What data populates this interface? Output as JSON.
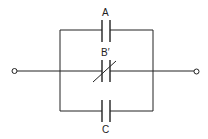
{
  "diagram": {
    "type": "circuit",
    "colors": {
      "line": "#222222",
      "background": "#ffffff"
    },
    "terminals": [
      {
        "id": "left-terminal"
      },
      {
        "id": "right-terminal"
      }
    ],
    "components": [
      {
        "id": "capacitor-a",
        "label": "A",
        "kind": "fixed-capacitor",
        "branch": "top"
      },
      {
        "id": "capacitor-b",
        "label": "B′",
        "kind": "variable-capacitor",
        "branch": "middle"
      },
      {
        "id": "capacitor-c",
        "label": "C",
        "kind": "fixed-capacitor",
        "branch": "bottom"
      }
    ]
  }
}
